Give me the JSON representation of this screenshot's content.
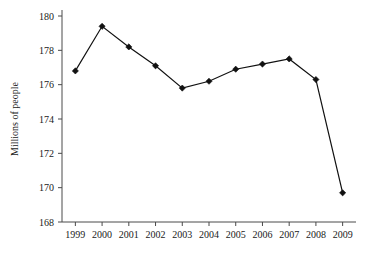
{
  "chart_data": {
    "type": "line",
    "title": "",
    "xlabel": "",
    "ylabel": "Millions of people",
    "categories": [
      "1999",
      "2000",
      "2001",
      "2002",
      "2003",
      "2004",
      "2005",
      "2006",
      "2007",
      "2008",
      "2009"
    ],
    "values": [
      176.8,
      179.4,
      178.2,
      177.1,
      175.8,
      176.2,
      176.9,
      177.2,
      177.5,
      176.3,
      169.7
    ],
    "ylim": [
      168,
      180
    ],
    "ytick_labels": [
      "168",
      "170",
      "172",
      "174",
      "176",
      "178",
      "180"
    ],
    "ytick_values": [
      168,
      170,
      172,
      174,
      176,
      178,
      180
    ],
    "grid": false,
    "legend": false,
    "marker": "diamond",
    "line_color": "#111111",
    "marker_color": "#111111",
    "axis_color": "#4a4a4a",
    "background_color": "#ffffff"
  }
}
